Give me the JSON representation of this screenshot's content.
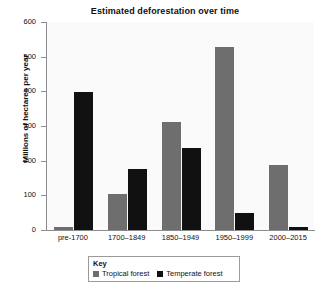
{
  "chart_data": {
    "type": "bar",
    "title": "Estimated deforestation over time",
    "xlabel": "",
    "ylabel": "Millions of hectares per year",
    "ylim": [
      0,
      600
    ],
    "yticks": [
      0,
      100,
      200,
      300,
      400,
      500,
      600
    ],
    "grid": false,
    "legend_position": "below-axis",
    "legend_title": "Key",
    "categories": [
      "pre-1700",
      "1700–1849",
      "1850–1949",
      "1950–1999",
      "2000–2015"
    ],
    "series": [
      {
        "name": "Tropical forest",
        "color": "#6e6e6e",
        "values": [
          10,
          105,
          313,
          528,
          188
        ]
      },
      {
        "name": "Temperate forest",
        "color": "#111111",
        "values": [
          399,
          177,
          238,
          50,
          8
        ]
      }
    ]
  },
  "colors": {
    "tropical": "#6e6e6e",
    "temperate": "#111111",
    "axis": "#8c8c8c",
    "plot_background": "#fafafa",
    "text": "#111111"
  }
}
